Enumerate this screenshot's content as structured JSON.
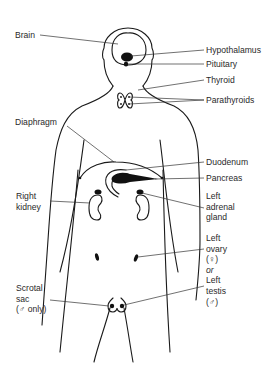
{
  "diagram": {
    "labels": {
      "brain": "Brain",
      "hypothalamus": "Hypothalamus",
      "pituitary": "Pituitary",
      "thyroid": "Thyroid",
      "parathyroids": "Parathyroids",
      "diaphragm": "Diaphragm",
      "duodenum": "Duodenum",
      "pancreas": "Pancreas",
      "right_kidney": [
        "Right",
        "kidney"
      ],
      "left_adrenal_gland": [
        "Left",
        "adrenal",
        "gland"
      ],
      "left_ovary": [
        "Left",
        "ovary",
        "(♀)"
      ],
      "or": "or",
      "left_testis": [
        "Left",
        "testis",
        "(♂)"
      ],
      "scrotal_sac": [
        "Scrotal",
        "sac",
        "(♂ only)"
      ]
    },
    "colors": {
      "line": "#1a1a1a",
      "text": "#2a2a2a",
      "background": "#ffffff"
    }
  }
}
